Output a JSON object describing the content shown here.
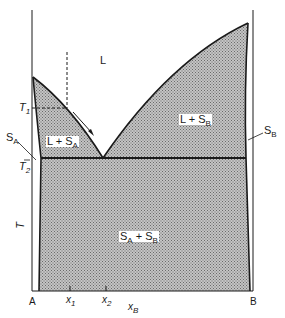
{
  "diagram": {
    "type": "binary eutectic phase diagram",
    "axes": {
      "left_component": "A",
      "right_component": "B",
      "x_axis_label": "x",
      "x_axis_label_sub": "B",
      "y_axis_label": "T",
      "x_ticks": [
        {
          "label": "x",
          "sub": "1"
        },
        {
          "label": "x",
          "sub": "2"
        }
      ],
      "temperature_marks": [
        {
          "label": "T",
          "sub": "1"
        },
        {
          "label": "T",
          "sub": "2"
        }
      ]
    },
    "regions": {
      "liquid": {
        "label": "L"
      },
      "liquid_plus_solid_a": {
        "label": "L + S",
        "sub": "A"
      },
      "liquid_plus_solid_b": {
        "label": "L + S",
        "sub": "B"
      },
      "solid_a_plus_solid_b": {
        "label_a": "S",
        "sub_a": "A",
        "plus": " + ",
        "label_b": "S",
        "sub_b": "B"
      }
    },
    "phase_labels": {
      "solid_a": {
        "label": "S",
        "sub": "A"
      },
      "solid_b": {
        "label": "S",
        "sub": "B"
      }
    },
    "colors": {
      "line": "#1a1a1a",
      "shading": "#9a9a9a",
      "background": "#ffffff"
    }
  }
}
